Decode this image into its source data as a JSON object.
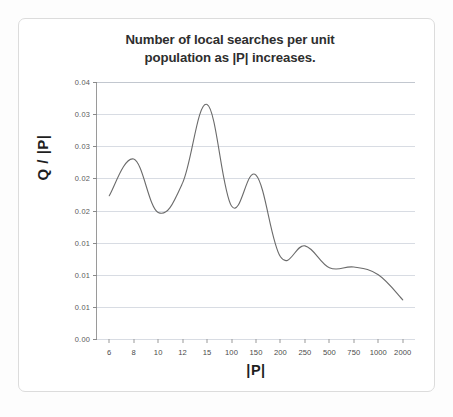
{
  "chart_data": {
    "type": "line",
    "title": "Number of local searches per unit population as |P| increases.",
    "title_lines": [
      "Number of local searches per unit",
      "population as |P| increases."
    ],
    "xlabel": "|P|",
    "ylabel": "Q / |P|",
    "grid": true,
    "legend": "none",
    "x_scale": "categorical",
    "categories": [
      "6",
      "8",
      "10",
      "12",
      "15",
      "100",
      "150",
      "200",
      "250",
      "500",
      "750",
      "1000",
      "2000"
    ],
    "values": [
      0.0223,
      0.028,
      0.0197,
      0.0243,
      0.0365,
      0.0207,
      0.0255,
      0.0128,
      0.0145,
      0.0111,
      0.0112,
      0.01,
      0.0061
    ],
    "series": [
      {
        "name": "Q / |P|",
        "color": "#6b6b6b",
        "values": [
          0.0223,
          0.028,
          0.0197,
          0.0243,
          0.0365,
          0.0207,
          0.0255,
          0.0128,
          0.0145,
          0.0111,
          0.0112,
          0.01,
          0.0061
        ]
      }
    ],
    "ylim": [
      0.0,
      0.04
    ],
    "ytick_values": [
      0.04,
      0.035,
      0.03,
      0.025,
      0.02,
      0.015,
      0.01,
      0.005,
      0.0
    ],
    "ytick_labels": [
      "0.04",
      "0.03",
      "0.03",
      "0.02",
      "0.02",
      "0.01",
      "0.01",
      "0.01",
      "0.00"
    ],
    "xtick_labels": [
      "6",
      "8",
      "10",
      "12",
      "15",
      "100",
      "150",
      "200",
      "250",
      "500",
      "750",
      "1000",
      "2000"
    ],
    "annotations": []
  },
  "colors": {
    "curve": "#6b6b6b",
    "grid": "#d8dce3",
    "axis": "#9a9a9a",
    "title_text": "#2e2e2e",
    "tick_text": "#4a4a4a",
    "page_border": "#dcdcdc",
    "background": "#ffffff"
  }
}
